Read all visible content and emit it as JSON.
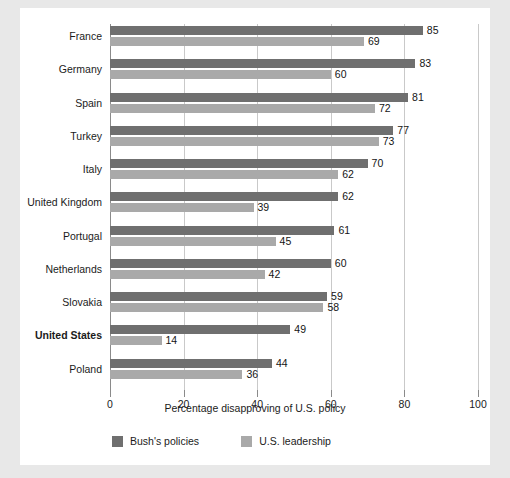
{
  "chart_data": {
    "type": "bar",
    "orientation": "horizontal",
    "title": "",
    "xlabel": "Percentage disapproving of U.S. policy",
    "ylabel": "",
    "xlim": [
      0,
      100
    ],
    "xticks": [
      0,
      20,
      40,
      60,
      80,
      100
    ],
    "grid": true,
    "legend_position": "bottom-left",
    "categories": [
      "France",
      "Germany",
      "Spain",
      "Turkey",
      "Italy",
      "United Kingdom",
      "Portugal",
      "Netherlands",
      "Slovakia",
      "United States",
      "Poland"
    ],
    "emphasized_category": "United States",
    "series": [
      {
        "name": "Bush's policies",
        "color": "#6f6f6f",
        "values": [
          85,
          83,
          81,
          77,
          70,
          62,
          61,
          60,
          59,
          49,
          44
        ]
      },
      {
        "name": "U.S. leadership",
        "color": "#a9a9a9",
        "values": [
          69,
          60,
          72,
          73,
          62,
          39,
          45,
          42,
          58,
          14,
          36
        ]
      }
    ]
  },
  "colors": {
    "page_background": "#e8e8e8",
    "card_background": "#ffffff",
    "gridline": "#c9c9c9",
    "axis": "#8a8a8a",
    "text": "#1b1b1b"
  }
}
